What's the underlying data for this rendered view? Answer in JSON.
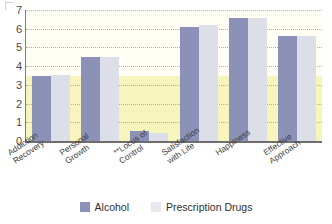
{
  "chart_data": {
    "type": "bar",
    "title": "",
    "subtitle": "",
    "xlabel": "",
    "ylabel": "",
    "ylim": [
      0,
      7
    ],
    "yticks": [
      0,
      1,
      2,
      3,
      4,
      5,
      6,
      7
    ],
    "grid": true,
    "grid_style": "dotted horizontal",
    "legend_position": "bottom-center",
    "categories": [
      "Addiction\nRecovery",
      "Personal\nGrowth",
      "**Locus of\nControl",
      "Satisfaction\nwith Life",
      "Happiness",
      "Effective\nApproach"
    ],
    "series": [
      {
        "name": "Alcohol",
        "color": "#8b91b7",
        "values": [
          3.5,
          4.5,
          0.55,
          6.1,
          6.6,
          5.6
        ]
      },
      {
        "name": "Prescription Drugs",
        "color": "#dcdfe8",
        "values": [
          3.55,
          4.5,
          0.45,
          6.2,
          6.6,
          5.6
        ]
      }
    ],
    "annotations": [
      "** denotes significance marker on Locus of Control"
    ],
    "plot_background": "#fffef4",
    "band_background": "#f8f4bd"
  },
  "legend": {
    "items": [
      {
        "label": "Alcohol",
        "color": "#8b91b7"
      },
      {
        "label": "Prescription Drugs",
        "color": "#e6e8ee"
      }
    ]
  },
  "axis": {
    "y_tick_labels": [
      "7",
      "6",
      "5",
      "4",
      "3",
      "2",
      "1",
      "0"
    ]
  }
}
